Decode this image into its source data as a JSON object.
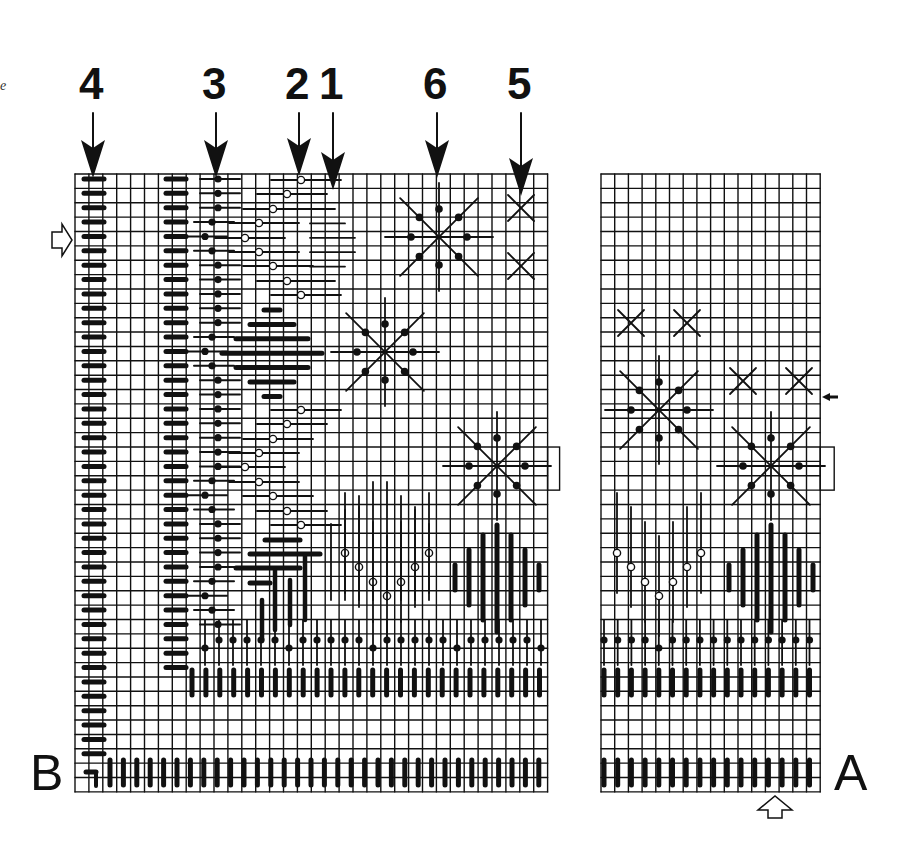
{
  "figure": {
    "type": "needlepoint stitch chart",
    "margin_text_fragment": "e",
    "column_labels": [
      {
        "label": "4",
        "x": 93
      },
      {
        "label": "3",
        "x": 216
      },
      {
        "label": "2",
        "x": 299
      },
      {
        "label": "1",
        "x": 333
      },
      {
        "label": "6",
        "x": 437
      },
      {
        "label": "5",
        "x": 521
      }
    ],
    "corner_labels": {
      "left": "B",
      "right": "A"
    },
    "colors": {
      "ink": "#111111",
      "paper": "#ffffff"
    }
  },
  "grids": {
    "left": {
      "x0": 75,
      "y0": 174,
      "cols": 34,
      "rows": 43,
      "cell_w": 13.9,
      "cell_h": 14.37
    },
    "right": {
      "x0": 601,
      "y0": 174,
      "cols": 16,
      "rows": 43,
      "cell_w": 13.7,
      "cell_h": 14.37
    }
  },
  "markers": {
    "left_arrow_y": 240,
    "right_small_arrow_y": 397,
    "bottom_arrow_x": 775
  },
  "stars": [
    {
      "grid": "left",
      "cx": 439,
      "cy": 237,
      "r": 54
    },
    {
      "grid": "left",
      "cx": 385,
      "cy": 352,
      "r": 54
    },
    {
      "grid": "left",
      "cx": 497,
      "cy": 466,
      "r": 54
    },
    {
      "grid": "right",
      "cx": 659,
      "cy": 410,
      "r": 54
    },
    {
      "grid": "right",
      "cx": 771,
      "cy": 466,
      "r": 54
    }
  ],
  "crosses": [
    {
      "cx": 521,
      "cy": 208
    },
    {
      "cx": 521,
      "cy": 266
    },
    {
      "cx": 631,
      "cy": 323
    },
    {
      "cx": 687,
      "cy": 323
    },
    {
      "cx": 743,
      "cy": 381
    },
    {
      "cx": 799,
      "cy": 381
    }
  ]
}
